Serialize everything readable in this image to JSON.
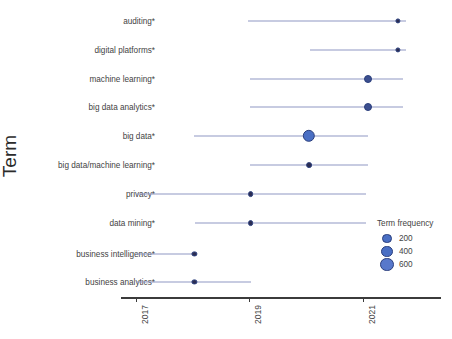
{
  "chart_data": {
    "type": "scatter",
    "title": "",
    "xlabel": "",
    "ylabel": "Term",
    "xlim": [
      2016.6,
      2022.2
    ],
    "x_ticks": [
      2017,
      2019,
      2021
    ],
    "x_tick_labels": [
      "2017",
      "2019",
      "2021"
    ],
    "grid": false,
    "legend": {
      "title": "Term frequency",
      "position": "right-bottom",
      "entries": [
        {
          "label": "200",
          "value": 200,
          "radius_px": 3.6
        },
        {
          "label": "400",
          "value": 400,
          "radius_px": 4.6
        },
        {
          "label": "600",
          "value": 600,
          "radius_px": 5.8
        }
      ]
    },
    "categories": [
      "auditing*",
      "digital platforms*",
      "machine learning*",
      "big data analytics*",
      "big data*",
      "big data/machine learning*",
      "privacy*",
      "data mining*",
      "business intelligence*",
      "business analytics*"
    ],
    "points": [
      {
        "term": "auditing*",
        "year": 2021.62,
        "frequency": 95,
        "range_start": 2018.98,
        "range_end": 2021.75
      },
      {
        "term": "digital platforms*",
        "year": 2021.62,
        "frequency": 90,
        "range_start": 2020.06,
        "range_end": 2021.75
      },
      {
        "term": "machine learning*",
        "year": 2021.08,
        "frequency": 240,
        "range_start": 2019.0,
        "range_end": 2021.7
      },
      {
        "term": "big data analytics*",
        "year": 2021.08,
        "frequency": 230,
        "range_start": 2019.0,
        "range_end": 2021.7
      },
      {
        "term": "big data*",
        "year": 2020.05,
        "frequency": 610,
        "range_start": 2018.02,
        "range_end": 2021.08
      },
      {
        "term": "big data/machine learning*",
        "year": 2020.05,
        "frequency": 150,
        "range_start": 2019.0,
        "range_end": 2021.08
      },
      {
        "term": "privacy*",
        "year": 2019.02,
        "frequency": 150,
        "range_start": 2017.02,
        "range_end": 2021.05
      },
      {
        "term": "data mining*",
        "year": 2019.02,
        "frequency": 150,
        "range_start": 2018.04,
        "range_end": 2021.05
      },
      {
        "term": "business intelligence*",
        "year": 2018.03,
        "frequency": 110,
        "range_start": 2017.0,
        "range_end": 2018.06
      },
      {
        "term": "business analytics*",
        "year": 2018.03,
        "frequency": 110,
        "range_start": 2017.0,
        "range_end": 2019.02
      }
    ]
  },
  "colors": {
    "line": "#9098c4",
    "dot_small": "#2b2d52",
    "dot_large": "#4a6fc4",
    "dot_edge": "#2b3f7d",
    "axis": "#3b3b3b",
    "text": "#434343"
  }
}
